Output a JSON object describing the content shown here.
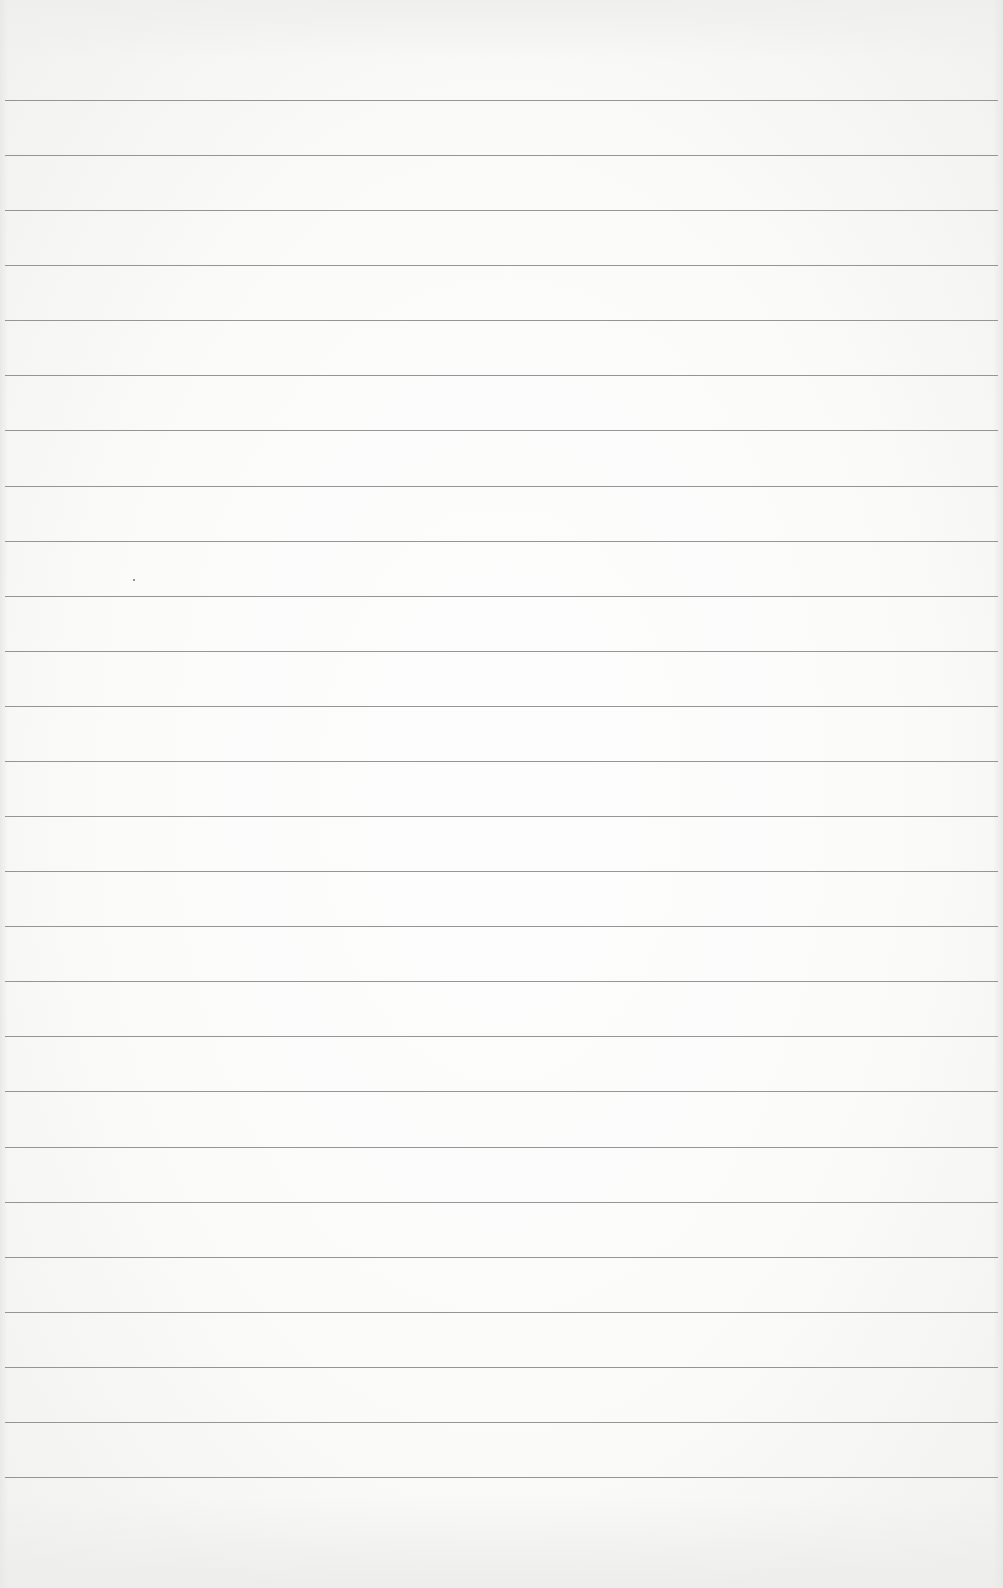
{
  "page": {
    "type": "lined-paper",
    "background_color": "#fafafa",
    "rule_color": "#8f8f8f",
    "rule_count": 26,
    "first_rule_y": 100,
    "rule_spacing": 55.08,
    "rule_x_start": 5,
    "rule_x_end": 998,
    "specks": [
      {
        "x": 133,
        "y": 579
      }
    ]
  }
}
